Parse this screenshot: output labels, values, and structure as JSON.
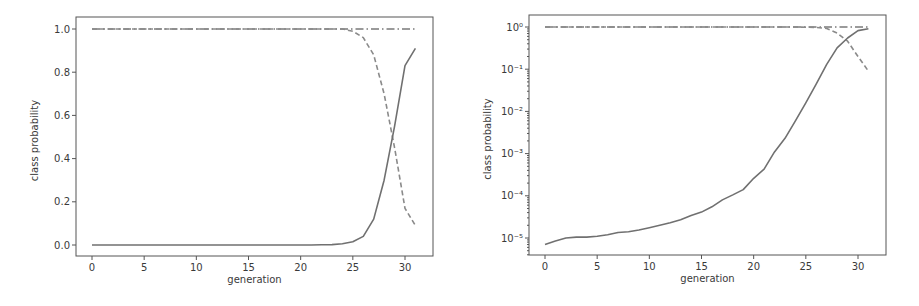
{
  "chart_data": [
    {
      "type": "line",
      "title": "",
      "xlabel": "generation",
      "ylabel": "class probability",
      "yscale": "linear",
      "xlim": [
        -1.5,
        32.5
      ],
      "ylim": [
        -0.05,
        1.05
      ],
      "xticks": [
        0,
        5,
        10,
        15,
        20,
        25,
        30
      ],
      "yticks": [
        0.0,
        0.2,
        0.4,
        0.6,
        0.8,
        1.0
      ],
      "ytick_labels": [
        "0.0",
        "0.2",
        "0.4",
        "0.6",
        "0.8",
        "1.0"
      ],
      "grid": false,
      "x": [
        0,
        1,
        2,
        3,
        4,
        5,
        6,
        7,
        8,
        9,
        10,
        11,
        12,
        13,
        14,
        15,
        16,
        17,
        18,
        19,
        20,
        21,
        22,
        23,
        24,
        25,
        26,
        27,
        28,
        29,
        30,
        31
      ],
      "series": [
        {
          "name": "class A (solid)",
          "style": "solid",
          "color": "#707070",
          "values": [
            0.0,
            0.0,
            0.0,
            0.0,
            0.0,
            0.0,
            0.0,
            0.0,
            0.0,
            0.0,
            0.0,
            0.0,
            0.0,
            0.0,
            0.0,
            0.0,
            0.0,
            0.0,
            0.0,
            0.0,
            0.0,
            0.0,
            0.001,
            0.002,
            0.006,
            0.015,
            0.04,
            0.12,
            0.3,
            0.55,
            0.83,
            0.91
          ]
        },
        {
          "name": "class B (dashed)",
          "style": "dashed",
          "color": "#8a8a8a",
          "values": [
            1.0,
            1.0,
            1.0,
            1.0,
            1.0,
            1.0,
            1.0,
            1.0,
            1.0,
            1.0,
            1.0,
            1.0,
            1.0,
            1.0,
            1.0,
            1.0,
            1.0,
            1.0,
            1.0,
            1.0,
            1.0,
            1.0,
            1.0,
            1.0,
            1.0,
            0.99,
            0.96,
            0.88,
            0.7,
            0.45,
            0.17,
            0.09
          ]
        },
        {
          "name": "class C (dash-dot)",
          "style": "dashdot",
          "color": "#7a7a7a",
          "values": [
            1.0,
            1.0,
            1.0,
            1.0,
            1.0,
            1.0,
            1.0,
            1.0,
            1.0,
            1.0,
            1.0,
            1.0,
            1.0,
            1.0,
            1.0,
            1.0,
            1.0,
            1.0,
            1.0,
            1.0,
            1.0,
            1.0,
            1.0,
            1.0,
            1.0,
            1.0,
            1.0,
            1.0,
            1.0,
            1.0,
            1.0,
            1.0
          ]
        }
      ]
    },
    {
      "type": "line",
      "title": "",
      "xlabel": "generation",
      "ylabel": "class probability",
      "yscale": "log",
      "xlim": [
        -1.5,
        32.5
      ],
      "ylim": [
        4e-06,
        1.8
      ],
      "xticks": [
        0,
        5,
        10,
        15,
        20,
        25,
        30
      ],
      "yticks": [
        1e-05,
        0.0001,
        0.001,
        0.01,
        0.1,
        1
      ],
      "ytick_labels": [
        "10⁻⁵",
        "10⁻⁴",
        "10⁻³",
        "10⁻²",
        "10⁻¹",
        "10⁰"
      ],
      "grid": false,
      "x": [
        0,
        1,
        2,
        3,
        4,
        5,
        6,
        7,
        8,
        9,
        10,
        11,
        12,
        13,
        14,
        15,
        16,
        17,
        18,
        19,
        20,
        21,
        22,
        23,
        24,
        25,
        26,
        27,
        28,
        29,
        30,
        31
      ],
      "series": [
        {
          "name": "class A (solid)",
          "style": "solid",
          "color": "#707070",
          "values": [
            7e-06,
            8.5e-06,
            1e-05,
            1.05e-05,
            1.05e-05,
            1.1e-05,
            1.2e-05,
            1.35e-05,
            1.4e-05,
            1.55e-05,
            1.75e-05,
            2e-05,
            2.3e-05,
            2.7e-05,
            3.4e-05,
            4.1e-05,
            5.5e-05,
            8e-05,
            0.000105,
            0.00014,
            0.00026,
            0.00043,
            0.0011,
            0.0023,
            0.006,
            0.016,
            0.045,
            0.13,
            0.32,
            0.55,
            0.82,
            0.91
          ]
        },
        {
          "name": "class B (dashed)",
          "style": "dashed",
          "color": "#8a8a8a",
          "values": [
            1.0,
            1.0,
            1.0,
            1.0,
            1.0,
            1.0,
            1.0,
            1.0,
            1.0,
            1.0,
            1.0,
            1.0,
            1.0,
            1.0,
            1.0,
            1.0,
            1.0,
            1.0,
            1.0,
            1.0,
            1.0,
            1.0,
            1.0,
            1.0,
            1.0,
            0.99,
            0.98,
            0.92,
            0.72,
            0.46,
            0.2,
            0.09
          ]
        },
        {
          "name": "class C (dash-dot)",
          "style": "dashdot",
          "color": "#7a7a7a",
          "values": [
            1.0,
            1.0,
            1.0,
            1.0,
            1.0,
            1.0,
            1.0,
            1.0,
            1.0,
            1.0,
            1.0,
            1.0,
            1.0,
            1.0,
            1.0,
            1.0,
            1.0,
            1.0,
            1.0,
            1.0,
            1.0,
            1.0,
            1.0,
            1.0,
            1.0,
            1.0,
            1.0,
            1.0,
            1.0,
            1.0,
            1.0,
            1.0
          ]
        }
      ]
    }
  ],
  "layout": {
    "panels": [
      {
        "box": [
          76,
          17,
          433,
          256
        ],
        "x0px": 92,
        "x30px": 405,
        "y": {
          "type": "linear",
          "v0": 0.0,
          "p0": 245,
          "v1": 1.0,
          "p1": 29
        }
      },
      {
        "box": [
          529,
          15,
          886,
          255
        ],
        "x0px": 545,
        "x30px": 858,
        "y": {
          "type": "log",
          "v0": -5,
          "p0": 238,
          "v1": 0,
          "p1": 27
        }
      }
    ]
  }
}
